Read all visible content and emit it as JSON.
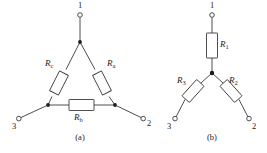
{
  "figure": {
    "background_color": "#ffffff",
    "line_color": "#3a3a3a",
    "text_color": "#222222",
    "panels": [
      {
        "id": "panel-a",
        "caption": "(a)",
        "topology": "delta",
        "resistors": [
          {
            "name": "R_c",
            "base": "R",
            "sub": "c",
            "label": "R",
            "subscript": "c",
            "position": "left-leg"
          },
          {
            "name": "R_a",
            "base": "R",
            "sub": "a",
            "label": "R",
            "subscript": "a",
            "position": "right-leg"
          },
          {
            "name": "R_b",
            "base": "R",
            "sub": "b",
            "label": "R",
            "subscript": "b",
            "position": "bottom-leg"
          }
        ],
        "terminals": [
          {
            "name": "terminal-1",
            "label": "1",
            "position": "top"
          },
          {
            "name": "terminal-2",
            "label": "2",
            "position": "bottom-right"
          },
          {
            "name": "terminal-3",
            "label": "3",
            "position": "bottom-left"
          }
        ]
      },
      {
        "id": "panel-b",
        "caption": "(b)",
        "topology": "wye",
        "resistors": [
          {
            "name": "R_1",
            "base": "R",
            "sub": "1",
            "label": "R",
            "subscript": "1",
            "position": "top-branch"
          },
          {
            "name": "R_2",
            "base": "R",
            "sub": "2",
            "label": "R",
            "subscript": "2",
            "position": "lower-right-branch"
          },
          {
            "name": "R_3",
            "base": "R",
            "sub": "3",
            "label": "R",
            "subscript": "3",
            "position": "lower-left-branch"
          }
        ],
        "terminals": [
          {
            "name": "terminal-1",
            "label": "1",
            "position": "top"
          },
          {
            "name": "terminal-2",
            "label": "2",
            "position": "bottom-right"
          },
          {
            "name": "terminal-3",
            "label": "3",
            "position": "bottom-left"
          }
        ]
      }
    ]
  }
}
